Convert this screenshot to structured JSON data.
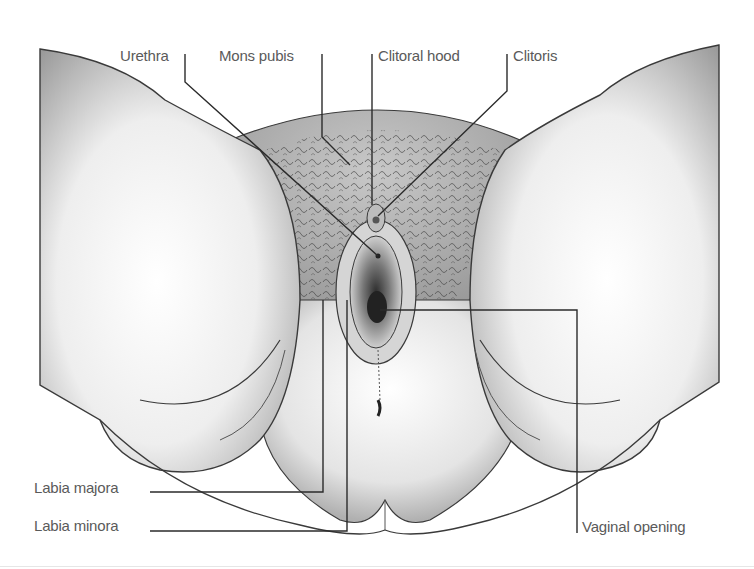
{
  "figure": {
    "colors": {
      "outline": "#3a3a3a",
      "leader": "#2b2b2b",
      "label_text": "#5a5a5a",
      "background": "#ffffff"
    }
  },
  "labels": [
    {
      "id": "urethra",
      "text": "Urethra",
      "x": 120,
      "y": 48
    },
    {
      "id": "mons-pubis",
      "text": "Mons pubis",
      "x": 219,
      "y": 48
    },
    {
      "id": "clitoral-hood",
      "text": "Clitoral hood",
      "x": 378,
      "y": 48
    },
    {
      "id": "clitoris",
      "text": "Clitoris",
      "x": 513,
      "y": 48
    },
    {
      "id": "labia-majora",
      "text": "Labia majora",
      "x": 34,
      "y": 480
    },
    {
      "id": "labia-minora",
      "text": "Labia minora",
      "x": 34,
      "y": 516
    },
    {
      "id": "vaginal-opening",
      "text": "Vaginal opening",
      "x": 582,
      "y": 518
    }
  ]
}
